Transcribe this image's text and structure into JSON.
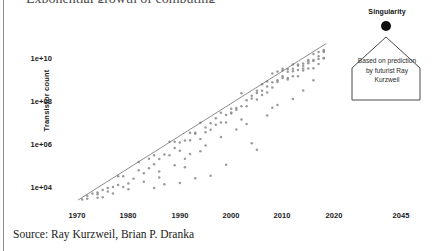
{
  "slide": {
    "title_remnant": "Exponential growth of computing",
    "source_line": "Source: Ray Kurzweil, Brian P. Dranka",
    "background_color": "#ffffff",
    "rule_color": "#8d8d8d"
  },
  "callout": {
    "singularity_label": "Singularity",
    "dot_color": "#0d0d0d",
    "body_text": "Based on prediction by futurist Ray Kurzweil",
    "border_color": "#4a4a4a"
  },
  "chart_data": {
    "type": "scatter",
    "title": "",
    "xlabel": "",
    "ylabel": "Transistor count",
    "grid": false,
    "legend": null,
    "yscale": "log",
    "ytick_labels": [
      "1e+04",
      "1e+06",
      "1e+08",
      "1e+10"
    ],
    "ytick_values": [
      10000,
      1000000,
      100000000,
      10000000000
    ],
    "ylim": [
      1000,
      100000000000
    ],
    "xtick_labels": [
      "1970",
      "1980",
      "1990",
      "2000",
      "2010",
      "2020",
      "2045"
    ],
    "xtick_values": [
      1970,
      1980,
      1990,
      2000,
      2010,
      2020,
      2045
    ],
    "xlim": [
      1968,
      2050
    ],
    "point_color": "#8a8a8a",
    "trendline_color": "#6e6e6e",
    "trendline": {
      "x": [
        1970.2,
        2018.5
      ],
      "y": [
        2200,
        48000000000
      ],
      "doubling_years": 2.0
    },
    "series": [
      {
        "name": "Transistor count",
        "points": [
          [
            1971,
            2300
          ],
          [
            1972,
            3500
          ],
          [
            1972,
            2500
          ],
          [
            1973,
            4500
          ],
          [
            1974,
            5000
          ],
          [
            1974,
            4100
          ],
          [
            1975,
            6500
          ],
          [
            1975,
            3000
          ],
          [
            1976,
            8000
          ],
          [
            1976,
            5500
          ],
          [
            1977,
            9000
          ],
          [
            1978,
            29000
          ],
          [
            1978,
            11000
          ],
          [
            1979,
            29000
          ],
          [
            1979,
            9000
          ],
          [
            1980,
            13000
          ],
          [
            1981,
            22000
          ],
          [
            1982,
            134000
          ],
          [
            1982,
            55000
          ],
          [
            1983,
            40000
          ],
          [
            1984,
            190000
          ],
          [
            1984,
            68000
          ],
          [
            1985,
            275000
          ],
          [
            1985,
            105000
          ],
          [
            1986,
            185000
          ],
          [
            1986,
            25000
          ],
          [
            1987,
            300000
          ],
          [
            1988,
            1200000
          ],
          [
            1988,
            275000
          ],
          [
            1989,
            1180000
          ],
          [
            1989,
            600000
          ],
          [
            1990,
            1100000
          ],
          [
            1990,
            450000
          ],
          [
            1991,
            1350000
          ],
          [
            1991,
            190000
          ],
          [
            1992,
            3100000
          ],
          [
            1992,
            1400000
          ],
          [
            1993,
            3100000
          ],
          [
            1993,
            2800000
          ],
          [
            1994,
            9300000
          ],
          [
            1994,
            1600000
          ],
          [
            1995,
            5500000
          ],
          [
            1995,
            3300000
          ],
          [
            1996,
            4300000
          ],
          [
            1996,
            8800000
          ],
          [
            1997,
            7500000
          ],
          [
            1997,
            15000000
          ],
          [
            1998,
            9500000
          ],
          [
            1998,
            27400000
          ],
          [
            1999,
            21300000
          ],
          [
            1999,
            9500000
          ],
          [
            2000,
            42000000
          ],
          [
            2000,
            25000000
          ],
          [
            2000,
            28000000
          ],
          [
            2001,
            45000000
          ],
          [
            2001,
            37500000
          ],
          [
            2002,
            220000000
          ],
          [
            2002,
            55000000
          ],
          [
            2003,
            105000000
          ],
          [
            2003,
            54300000
          ],
          [
            2004,
            169000000
          ],
          [
            2004,
            125000000
          ],
          [
            2005,
            228000000
          ],
          [
            2005,
            112000000
          ],
          [
            2005,
            291000000
          ],
          [
            2006,
            291000000
          ],
          [
            2006,
            184000000
          ],
          [
            2006,
            582000000
          ],
          [
            2007,
            789000000
          ],
          [
            2007,
            463000000
          ],
          [
            2007,
            241000000
          ],
          [
            2008,
            1900000000
          ],
          [
            2008,
            731000000
          ],
          [
            2008,
            410000000
          ],
          [
            2008,
            47000000
          ],
          [
            2009,
            2300000000
          ],
          [
            2009,
            904000000
          ],
          [
            2009,
            758000000
          ],
          [
            2010,
            2600000000
          ],
          [
            2010,
            1170000000
          ],
          [
            2010,
            1400000000
          ],
          [
            2010,
            3100000000
          ],
          [
            2011,
            2270000000
          ],
          [
            2011,
            1160000000
          ],
          [
            2011,
            995000000
          ],
          [
            2011,
            3000000000
          ],
          [
            2012,
            5000000000
          ],
          [
            2012,
            2400000000
          ],
          [
            2012,
            1400000000
          ],
          [
            2012,
            3100000000
          ],
          [
            2013,
            5000000000
          ],
          [
            2013,
            4310000000
          ],
          [
            2013,
            1400000000
          ],
          [
            2013,
            2750000000
          ],
          [
            2014,
            4310000000
          ],
          [
            2014,
            5560000000
          ],
          [
            2014,
            2600000000
          ],
          [
            2014,
            3200000000
          ],
          [
            2015,
            8000000000
          ],
          [
            2015,
            5700000000
          ],
          [
            2015,
            3200000000
          ],
          [
            2015,
            7100000000
          ],
          [
            2016,
            7200000000
          ],
          [
            2016,
            15300000000
          ],
          [
            2016,
            8000000000
          ],
          [
            2016,
            3300000000
          ],
          [
            2017,
            19200000000
          ],
          [
            2017,
            8900000000
          ],
          [
            2017,
            12000000000
          ],
          [
            2017,
            5300000000
          ],
          [
            2018,
            21100000000
          ],
          [
            2018,
            9700000000
          ],
          [
            2018,
            19200000000
          ],
          [
            2018,
            23600000000
          ],
          [
            2018,
            10000000000
          ],
          [
            2005,
            500000
          ],
          [
            2004,
            1000000
          ],
          [
            1999,
            100000
          ],
          [
            1996,
            30000
          ],
          [
            1993,
            23000
          ],
          [
            1990,
            14000
          ],
          [
            1987,
            12000
          ],
          [
            1985,
            8000
          ],
          [
            2003,
            8000000
          ],
          [
            2001,
            4500000
          ],
          [
            2014,
            300000000
          ],
          [
            2012,
            120000000
          ],
          [
            2009,
            62000000
          ],
          [
            2007,
            20000000
          ],
          [
            1998,
            2000000
          ],
          [
            1995,
            800000
          ],
          [
            1992,
            320000
          ],
          [
            1989,
            95000
          ],
          [
            1986,
            48000
          ],
          [
            1983,
            16000
          ],
          [
            1980,
            7000
          ],
          [
            1977,
            4500
          ],
          [
            1974,
            2800
          ],
          [
            2016,
            900000000
          ],
          [
            2002,
            13000000
          ],
          [
            1994,
            430000
          ],
          [
            1991,
            76000
          ]
        ]
      }
    ]
  }
}
